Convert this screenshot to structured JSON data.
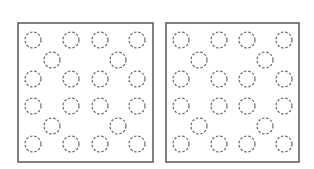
{
  "colors": {
    "background": "#ffffff",
    "frame": "#555555",
    "circle_stroke": "#666666"
  },
  "panels": [
    {
      "name": "left-panel",
      "x": 18,
      "y": 23,
      "w": 135,
      "h": 139,
      "circles": [
        [
          33,
          40
        ],
        [
          71,
          40
        ],
        [
          100,
          40
        ],
        [
          137,
          40
        ],
        [
          52,
          60
        ],
        [
          118,
          60
        ],
        [
          33,
          79
        ],
        [
          71,
          79
        ],
        [
          100,
          79
        ],
        [
          137,
          79
        ],
        [
          33,
          106
        ],
        [
          71,
          106
        ],
        [
          100,
          106
        ],
        [
          137,
          106
        ],
        [
          52,
          126
        ],
        [
          118,
          126
        ],
        [
          33,
          144
        ],
        [
          71,
          144
        ],
        [
          100,
          144
        ],
        [
          137,
          144
        ]
      ]
    },
    {
      "name": "right-panel",
      "x": 166,
      "y": 23,
      "w": 133,
      "h": 139,
      "circles": [
        [
          181,
          40
        ],
        [
          219,
          40
        ],
        [
          247,
          40
        ],
        [
          284,
          40
        ],
        [
          199,
          60
        ],
        [
          265,
          60
        ],
        [
          181,
          79
        ],
        [
          219,
          79
        ],
        [
          247,
          79
        ],
        [
          284,
          79
        ],
        [
          181,
          106
        ],
        [
          219,
          106
        ],
        [
          247,
          106
        ],
        [
          284,
          106
        ],
        [
          199,
          126
        ],
        [
          265,
          126
        ],
        [
          181,
          144
        ],
        [
          219,
          144
        ],
        [
          247,
          144
        ],
        [
          284,
          144
        ]
      ]
    }
  ],
  "circle_radius": 8
}
